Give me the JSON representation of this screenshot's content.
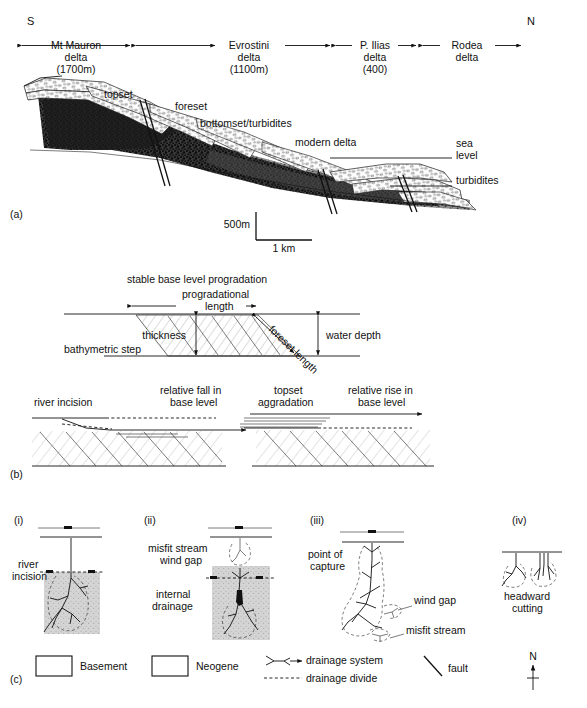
{
  "figure": {
    "panels": [
      "(a)",
      "(b)",
      "(c)"
    ]
  },
  "panel_a": {
    "label": "(a)",
    "orientation_left": "S",
    "orientation_right": "N",
    "deltas": [
      {
        "name": "Mt Mauron",
        "word2": "delta",
        "elevation": "(1700m)"
      },
      {
        "name": "Evrostini",
        "word2": "delta",
        "elevation": "(1100m)"
      },
      {
        "name": "P. Ilias",
        "word2": "delta",
        "elevation": "(400)"
      },
      {
        "name": "Rodea",
        "word2": "delta",
        "elevation": ""
      }
    ],
    "annotations": {
      "topset": "topset",
      "foreset": "foreset",
      "bottomset": "bottomset/turbidites",
      "modern_delta": "modern delta",
      "sea_level_1": "sea",
      "sea_level_2": "level",
      "turbidites": "turbidites"
    },
    "scale": {
      "vertical": "500m",
      "horizontal": "1 km"
    }
  },
  "panel_b": {
    "label": "(b)",
    "top": {
      "title": "stable base level progradation",
      "prograd_1": "progradational",
      "prograd_2": "length",
      "thickness": "thickness",
      "foreset_length": "foreset length",
      "water_depth": "water depth",
      "bathymetric_step": "bathymetric step"
    },
    "bottom_left": {
      "river_incision": "river incision",
      "fall_1": "relative fall in",
      "fall_2": "base level"
    },
    "bottom_right": {
      "topset_1": "topset",
      "topset_2": "aggradation",
      "rise_1": "relative rise in",
      "rise_2": "base level"
    }
  },
  "panel_c": {
    "label": "(c)",
    "stages": [
      {
        "num": "(i)",
        "lines": [
          "river",
          "incision"
        ],
        "extra": []
      },
      {
        "num": "(ii)",
        "lines": [
          "misfit stream",
          "wind gap"
        ],
        "extra": [
          "internal",
          "drainage"
        ]
      },
      {
        "num": "(iii)",
        "lines": [
          "point of",
          "capture"
        ],
        "extra": [
          "wind gap",
          "misfit stream"
        ]
      },
      {
        "num": "(iv)",
        "lines": [
          "headward",
          "cutting"
        ],
        "extra": []
      }
    ],
    "legend": {
      "basement": "Basement",
      "neogene": "Neogene",
      "drainage_system": "drainage system",
      "drainage_divide": "drainage divide",
      "fault": "fault",
      "north": "N"
    }
  },
  "colors": {
    "ink": "#111111",
    "basement_dark": "#2b2b2b",
    "neogene_gray": "#cfcfcf",
    "hatch": "#8c8c8c",
    "page": "#ffffff"
  }
}
